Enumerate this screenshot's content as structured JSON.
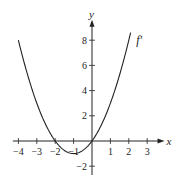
{
  "chart_data": {
    "type": "line",
    "title": "",
    "xlabel": "x",
    "ylabel": "y",
    "xlim": [
      -4.3,
      3.4
    ],
    "ylim": [
      -2.7,
      9.3
    ],
    "x_ticks": [
      -4,
      -3,
      -2,
      -1,
      1,
      2,
      3
    ],
    "x_tick_labels": [
      "−4",
      "−3",
      "−2",
      "−1",
      "1",
      "2",
      "3"
    ],
    "y_ticks": [
      -2,
      2,
      4,
      6,
      8
    ],
    "y_tick_labels": [
      "−2",
      "2",
      "4",
      "6",
      "8"
    ],
    "grid": false,
    "series": [
      {
        "name": "f′",
        "label": "f′",
        "formula": "y = x^2 + 2x",
        "x": [
          -4,
          -3.5,
          -3,
          -2.5,
          -2,
          -1.5,
          -1,
          -0.5,
          0,
          0.5,
          1,
          1.5,
          2,
          2.1
        ],
        "values": [
          8,
          5.25,
          3,
          1.25,
          0,
          -0.75,
          -1,
          -0.75,
          0,
          1.25,
          3,
          5.25,
          8,
          8.61
        ],
        "color": "#222222"
      }
    ],
    "annotations": [
      {
        "text": "f′",
        "x": 2.4,
        "y": 8
      }
    ]
  }
}
